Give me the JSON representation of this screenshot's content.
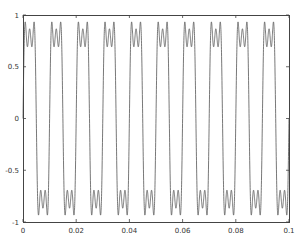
{
  "chart_data": {
    "type": "line",
    "title": "",
    "xlabel": "",
    "ylabel": "",
    "xlim": [
      0,
      0.1
    ],
    "ylim": [
      -1,
      1
    ],
    "grid": false,
    "legend": null,
    "series": [
      {
        "name": "signal",
        "function": "sin(2*pi*100*t) + sin(3*2*pi*100*t)/3 + sin(5*2*pi*100*t)/5",
        "period": 0.01,
        "harmonics": [
          1,
          3,
          5
        ],
        "peak_value": 0.93,
        "plateau_center_value": 0.867,
        "color": "#555555"
      }
    ],
    "x_ticks": [
      {
        "value": 0,
        "label": "0"
      },
      {
        "value": 0.02,
        "label": "0.02"
      },
      {
        "value": 0.04,
        "label": "0.04"
      },
      {
        "value": 0.06,
        "label": "0.06"
      },
      {
        "value": 0.08,
        "label": "0.08"
      },
      {
        "value": 0.1,
        "label": "0.1"
      }
    ],
    "y_ticks": [
      {
        "value": 1,
        "label": "1"
      },
      {
        "value": 0.5,
        "label": "0.5"
      },
      {
        "value": 0,
        "label": "0"
      },
      {
        "value": -0.5,
        "label": "-0.5"
      },
      {
        "value": -1,
        "label": "-1"
      }
    ]
  },
  "layout": {
    "plot_left": 23,
    "plot_top": 15,
    "plot_right": 289,
    "plot_bottom": 222,
    "frame_color": "#444444",
    "line_color": "#555555"
  }
}
